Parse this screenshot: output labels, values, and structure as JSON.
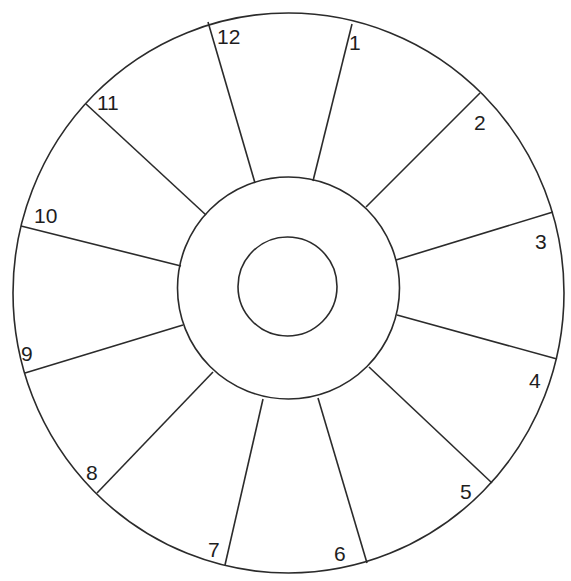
{
  "diagram": {
    "type": "twelve-segment wheel",
    "stroke_color": "#2b2b2b",
    "background": "#ffffff",
    "outer_ellipse": {
      "cx": 288.5,
      "cy": 293,
      "rx": 275.5,
      "ry": 280
    },
    "middle_circle": {
      "cx": 288.5,
      "cy": 288,
      "r": 111
    },
    "inner_circle": {
      "cx": 287.5,
      "cy": 286.5,
      "r": 49.5
    },
    "segments": [
      {
        "label": "1",
        "label_pos": [
          349,
          50
        ],
        "spoke": {
          "outer": [
            352,
            24
          ],
          "inner": [
            313,
            181
          ]
        }
      },
      {
        "label": "2",
        "label_pos": [
          474,
          130
        ],
        "spoke": {
          "outer": [
            480,
            93
          ],
          "inner": [
            366,
            207
          ]
        }
      },
      {
        "label": "3",
        "label_pos": [
          535,
          249
        ],
        "spoke": {
          "outer": [
            553,
            212
          ],
          "inner": [
            396,
            260
          ]
        }
      },
      {
        "label": "4",
        "label_pos": [
          529,
          388
        ],
        "spoke": {
          "outer": [
            557,
            359
          ],
          "inner": [
            397,
            315
          ]
        }
      },
      {
        "label": "5",
        "label_pos": [
          460,
          499
        ],
        "spoke": {
          "outer": [
            492,
            483
          ],
          "inner": [
            369,
            367
          ]
        }
      },
      {
        "label": "6",
        "label_pos": [
          334,
          561
        ],
        "spoke": {
          "outer": [
            367,
            563
          ],
          "inner": [
            318,
            398
          ]
        }
      },
      {
        "label": "7",
        "label_pos": [
          208,
          557
        ],
        "spoke": {
          "outer": [
            225,
            565
          ],
          "inner": [
            263,
            399
          ]
        }
      },
      {
        "label": "8",
        "label_pos": [
          86,
          480
        ],
        "spoke": {
          "outer": [
            97,
            493
          ],
          "inner": [
            213,
            372
          ]
        }
      },
      {
        "label": "9",
        "label_pos": [
          21,
          361
        ],
        "spoke": {
          "outer": [
            25,
            373
          ],
          "inner": [
            183,
            325
          ]
        }
      },
      {
        "label": "10",
        "label_pos": [
          34,
          223
        ],
        "spoke": {
          "outer": [
            21,
            226
          ],
          "inner": [
            181,
            266
          ]
        }
      },
      {
        "label": "11",
        "label_pos": [
          97,
          110
        ],
        "spoke": {
          "outer": [
            86,
            104
          ],
          "inner": [
            206,
            215
          ]
        }
      },
      {
        "label": "12",
        "label_pos": [
          217,
          44
        ],
        "spoke": {
          "outer": [
            208,
            22
          ],
          "inner": [
            255,
            183
          ]
        }
      }
    ]
  }
}
